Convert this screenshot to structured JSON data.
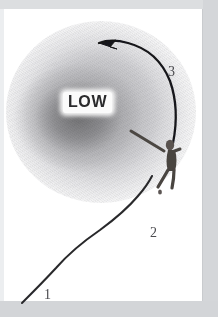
{
  "figure": {
    "name": "hurricane-low-pressure-flight-path-diagram",
    "title": "LOW"
  },
  "cloud": {
    "label": "LOW",
    "center_color": "#6e6e70",
    "mid_color": "#b0b0b4",
    "edge_color": "#e4e4e6"
  },
  "stages": [
    {
      "id": "stage-1",
      "label": "1",
      "meaning": "approach-leg"
    },
    {
      "id": "stage-2",
      "label": "2",
      "meaning": "entry-leg"
    },
    {
      "id": "stage-3",
      "label": "3",
      "meaning": "orbit-leg"
    }
  ],
  "paths": {
    "approach_path_name": "approach-track-line",
    "orbit_arrow_name": "counterclockwise-orbit-arrow",
    "line_color": "#2b2b2d"
  },
  "actor": {
    "name": "flying-figure",
    "color": "#4b4643"
  },
  "page": {
    "border_color": "#d4d6d9",
    "background_color": "#ffffff"
  }
}
